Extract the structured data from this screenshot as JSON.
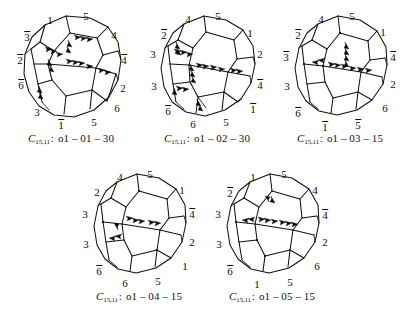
{
  "figure": {
    "background_color": "#ffffff",
    "ink_color": "#111111",
    "panel_count": 5,
    "layout": "3 panels top row, 2 panels bottom row"
  },
  "panels": [
    {
      "id": "panel-1",
      "caption": {
        "symbol": "C",
        "subscript": "15,11",
        "separator": ":",
        "code": "o1 – 01 – 30",
        "full": "C15,11 : o1 – 01 – 30"
      },
      "labels": [
        {
          "text": "1",
          "bar": false,
          "x": 46,
          "y": 18
        },
        {
          "text": "5",
          "bar": false,
          "x": 82,
          "y": 14
        },
        {
          "text": "3",
          "bar": true,
          "x": 23,
          "y": 34
        },
        {
          "text": "4",
          "bar": false,
          "x": 110,
          "y": 33
        },
        {
          "text": "2",
          "bar": true,
          "x": 16,
          "y": 57
        },
        {
          "text": "4",
          "bar": true,
          "x": 120,
          "y": 57
        },
        {
          "text": "6",
          "bar": true,
          "x": 17,
          "y": 82
        },
        {
          "text": "2",
          "bar": false,
          "x": 119,
          "y": 86
        },
        {
          "text": "3",
          "bar": false,
          "x": 33,
          "y": 110
        },
        {
          "text": "6",
          "bar": false,
          "x": 113,
          "y": 106
        },
        {
          "text": "1",
          "bar": true,
          "x": 57,
          "y": 122
        },
        {
          "text": "5",
          "bar": false,
          "x": 90,
          "y": 120
        }
      ]
    },
    {
      "id": "panel-2",
      "caption": {
        "symbol": "C",
        "subscript": "15,11",
        "separator": ":",
        "code": "o1 – 02 – 30",
        "full": "C15,11 : o1 – 02 – 30"
      },
      "labels": [
        {
          "text": "4",
          "bar": false,
          "x": 48,
          "y": 17
        },
        {
          "text": "5",
          "bar": false,
          "x": 78,
          "y": 14
        },
        {
          "text": "2",
          "bar": true,
          "x": 24,
          "y": 32
        },
        {
          "text": "1",
          "bar": false,
          "x": 110,
          "y": 31
        },
        {
          "text": "3",
          "bar": false,
          "x": 13,
          "y": 52
        },
        {
          "text": "2",
          "bar": false,
          "x": 120,
          "y": 52
        },
        {
          "text": "3",
          "bar": false,
          "x": 14,
          "y": 84
        },
        {
          "text": "4",
          "bar": true,
          "x": 120,
          "y": 82
        },
        {
          "text": "6",
          "bar": true,
          "x": 28,
          "y": 108
        },
        {
          "text": "1",
          "bar": true,
          "x": 113,
          "y": 106
        },
        {
          "text": "6",
          "bar": false,
          "x": 53,
          "y": 122
        },
        {
          "text": "5",
          "bar": false,
          "x": 86,
          "y": 120
        }
      ]
    },
    {
      "id": "panel-3",
      "caption": {
        "symbol": "C",
        "subscript": "15,11",
        "separator": ":",
        "code": "o1 – 03 – 15",
        "full": "C15,11 : o1 – 03 – 15"
      },
      "labels": [
        {
          "text": "4",
          "bar": false,
          "x": 48,
          "y": 17
        },
        {
          "text": "5",
          "bar": false,
          "x": 79,
          "y": 14
        },
        {
          "text": "2",
          "bar": true,
          "x": 25,
          "y": 32
        },
        {
          "text": "1",
          "bar": false,
          "x": 110,
          "y": 30
        },
        {
          "text": "3",
          "bar": true,
          "x": 13,
          "y": 54
        },
        {
          "text": "4",
          "bar": true,
          "x": 120,
          "y": 54
        },
        {
          "text": "3",
          "bar": false,
          "x": 14,
          "y": 84
        },
        {
          "text": "2",
          "bar": false,
          "x": 120,
          "y": 82
        },
        {
          "text": "6",
          "bar": true,
          "x": 25,
          "y": 110
        },
        {
          "text": "6",
          "bar": false,
          "x": 112,
          "y": 106
        },
        {
          "text": "1",
          "bar": true,
          "x": 52,
          "y": 124
        },
        {
          "text": "5",
          "bar": true,
          "x": 85,
          "y": 122
        }
      ]
    },
    {
      "id": "panel-4",
      "caption": {
        "symbol": "C",
        "subscript": "15,11",
        "separator": ":",
        "code": "o1 – 04 – 15",
        "full": "C15,11 : o1 – 04 – 15"
      },
      "labels": [
        {
          "text": "4",
          "bar": false,
          "x": 48,
          "y": 17
        },
        {
          "text": "5",
          "bar": false,
          "x": 78,
          "y": 14
        },
        {
          "text": "2",
          "bar": false,
          "x": 25,
          "y": 32
        },
        {
          "text": "1",
          "bar": false,
          "x": 110,
          "y": 30
        },
        {
          "text": "3",
          "bar": false,
          "x": 13,
          "y": 54
        },
        {
          "text": "4",
          "bar": true,
          "x": 120,
          "y": 53
        },
        {
          "text": "3",
          "bar": false,
          "x": 14,
          "y": 84
        },
        {
          "text": "2",
          "bar": false,
          "x": 120,
          "y": 82
        },
        {
          "text": "6",
          "bar": true,
          "x": 27,
          "y": 110
        },
        {
          "text": "1",
          "bar": false,
          "x": 113,
          "y": 106
        },
        {
          "text": "6",
          "bar": false,
          "x": 53,
          "y": 123
        },
        {
          "text": "5",
          "bar": false,
          "x": 86,
          "y": 121
        }
      ]
    },
    {
      "id": "panel-5",
      "caption": {
        "symbol": "C",
        "subscript": "15,11",
        "separator": ":",
        "code": "o1 – 05 – 15",
        "full": "C15,11 : o1 – 05 – 15"
      },
      "labels": [
        {
          "text": "1",
          "bar": false,
          "x": 48,
          "y": 17
        },
        {
          "text": "5",
          "bar": false,
          "x": 79,
          "y": 14
        },
        {
          "text": "2",
          "bar": true,
          "x": 25,
          "y": 32
        },
        {
          "text": "4",
          "bar": false,
          "x": 110,
          "y": 30
        },
        {
          "text": "3",
          "bar": false,
          "x": 13,
          "y": 54
        },
        {
          "text": "4",
          "bar": true,
          "x": 120,
          "y": 54
        },
        {
          "text": "3",
          "bar": false,
          "x": 14,
          "y": 84
        },
        {
          "text": "2",
          "bar": false,
          "x": 120,
          "y": 82
        },
        {
          "text": "6",
          "bar": true,
          "x": 25,
          "y": 110
        },
        {
          "text": "6",
          "bar": false,
          "x": 112,
          "y": 106
        },
        {
          "text": "1",
          "bar": false,
          "x": 52,
          "y": 124
        },
        {
          "text": "5",
          "bar": false,
          "x": 85,
          "y": 122
        }
      ]
    }
  ]
}
